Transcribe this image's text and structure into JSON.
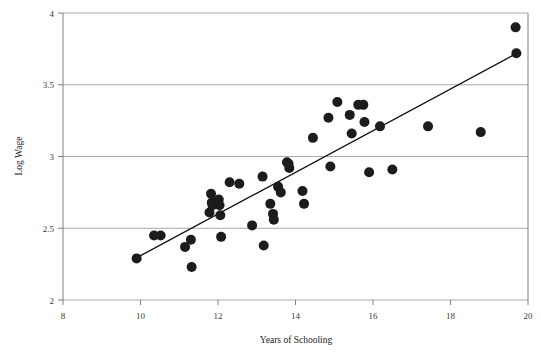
{
  "figure": {
    "background": "#ffffff",
    "point_color": "#1c1c1c",
    "line_color": "#111111",
    "grid_color": "#a8a8a8",
    "axis_color": "#808080"
  },
  "chart_data": {
    "type": "scatter",
    "title": "",
    "xlabel": "Years of Schooling",
    "ylabel": "Log Wage",
    "xlim": [
      8,
      20
    ],
    "ylim": [
      2,
      4
    ],
    "xticks": [
      8,
      10,
      12,
      14,
      16,
      18,
      20
    ],
    "yticks": [
      2,
      2.5,
      3,
      3.5,
      4
    ],
    "xtick_labels": [
      "8",
      "10",
      "12",
      "14",
      "16",
      "18",
      "20"
    ],
    "ytick_labels": [
      "2",
      "2.5",
      "3",
      "3.5",
      "4"
    ],
    "grid": "horizontal",
    "legend": "none",
    "marker": "filled-circle",
    "marker_size": 5,
    "points": [
      {
        "x": 9.9,
        "y": 2.29
      },
      {
        "x": 10.35,
        "y": 2.45
      },
      {
        "x": 10.52,
        "y": 2.45
      },
      {
        "x": 11.15,
        "y": 2.37
      },
      {
        "x": 11.3,
        "y": 2.42
      },
      {
        "x": 11.32,
        "y": 2.23
      },
      {
        "x": 11.78,
        "y": 2.61
      },
      {
        "x": 11.82,
        "y": 2.74
      },
      {
        "x": 11.84,
        "y": 2.68
      },
      {
        "x": 11.86,
        "y": 2.66
      },
      {
        "x": 12.02,
        "y": 2.7
      },
      {
        "x": 12.04,
        "y": 2.66
      },
      {
        "x": 12.06,
        "y": 2.59
      },
      {
        "x": 12.08,
        "y": 2.44
      },
      {
        "x": 12.3,
        "y": 2.82
      },
      {
        "x": 12.55,
        "y": 2.81
      },
      {
        "x": 12.88,
        "y": 2.52
      },
      {
        "x": 13.15,
        "y": 2.86
      },
      {
        "x": 13.18,
        "y": 2.38
      },
      {
        "x": 13.35,
        "y": 2.67
      },
      {
        "x": 13.42,
        "y": 2.6
      },
      {
        "x": 13.44,
        "y": 2.56
      },
      {
        "x": 13.55,
        "y": 2.79
      },
      {
        "x": 13.62,
        "y": 2.75
      },
      {
        "x": 13.78,
        "y": 2.96
      },
      {
        "x": 13.82,
        "y": 2.95
      },
      {
        "x": 13.84,
        "y": 2.92
      },
      {
        "x": 14.18,
        "y": 2.76
      },
      {
        "x": 14.22,
        "y": 2.67
      },
      {
        "x": 14.45,
        "y": 3.13
      },
      {
        "x": 14.85,
        "y": 3.27
      },
      {
        "x": 14.9,
        "y": 2.93
      },
      {
        "x": 15.08,
        "y": 3.38
      },
      {
        "x": 15.4,
        "y": 3.29
      },
      {
        "x": 15.45,
        "y": 3.16
      },
      {
        "x": 15.62,
        "y": 3.36
      },
      {
        "x": 15.75,
        "y": 3.36
      },
      {
        "x": 15.78,
        "y": 3.24
      },
      {
        "x": 15.9,
        "y": 2.89
      },
      {
        "x": 16.18,
        "y": 3.21
      },
      {
        "x": 16.5,
        "y": 2.91
      },
      {
        "x": 17.42,
        "y": 3.21
      },
      {
        "x": 18.78,
        "y": 3.17
      },
      {
        "x": 19.68,
        "y": 3.9
      },
      {
        "x": 19.7,
        "y": 3.72
      }
    ],
    "fit_line": {
      "label": "linear fit",
      "x0": 9.87,
      "y0": 2.29,
      "x1": 19.72,
      "y1": 3.72
    }
  }
}
